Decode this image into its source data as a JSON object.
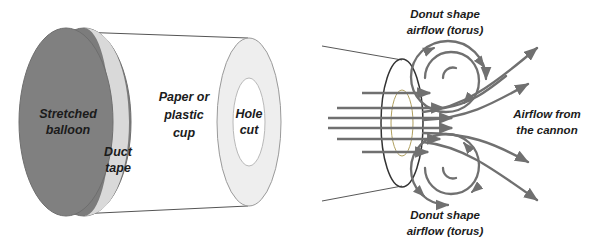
{
  "figure": {
    "background_color": "#ffffff"
  },
  "colors": {
    "balloon_fill": "#808080",
    "balloon_edge": "#6e6e6e",
    "duct_tape_fill": "#d9d9d9",
    "cup_body_fill": "#ffffff",
    "cup_rim_fill": "#eeeeee",
    "hole_fill": "#ffffff",
    "outline": "#555555",
    "airflow_line": "#707070",
    "aperture_outline": "#333333",
    "inner_ellipse_outline": "#b0a060",
    "text": "#1b1b1b"
  },
  "left_diagram": {
    "name": "vortex-cannon-construction",
    "labels": {
      "stretched_balloon": {
        "line1": "Stretched",
        "line2": "balloon"
      },
      "duct_tape": {
        "line1": "Duct",
        "line2": "tape"
      },
      "paper_or_plastic_cup": {
        "line1": "Paper or",
        "line2": "plastic",
        "line3": "cup"
      },
      "hole_cut": {
        "line1": "Hole",
        "line2": "cut"
      }
    }
  },
  "right_diagram": {
    "name": "vortex-cannon-airflow",
    "labels": {
      "donut_top": {
        "line1": "Donut shape",
        "line2": "airflow (torus)"
      },
      "donut_bottom": {
        "line1": "Donut shape",
        "line2": "airflow (torus)"
      },
      "airflow_from_cannon": {
        "line1": "Airflow from",
        "line2": "the cannon"
      }
    },
    "elements": {
      "aperture_ellipse": "cannon-mouth-ellipse",
      "inner_ellipse": "cannon-hole-ellipse",
      "inflow_streamline_count": 6,
      "outflow_streamline_count": 5,
      "vortex_spiral_count": 2
    }
  }
}
